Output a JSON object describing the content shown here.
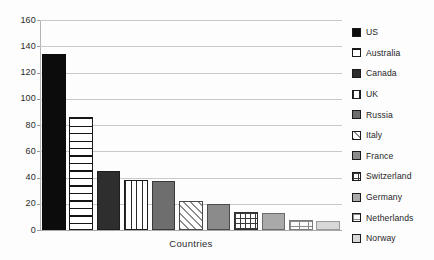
{
  "chart_data": {
    "type": "bar",
    "title": "",
    "xlabel": "Countries",
    "ylabel": "",
    "ylim": [
      0,
      160
    ],
    "ytick_step": 20,
    "yticks": [
      160,
      140,
      120,
      100,
      80,
      60,
      40,
      20,
      0
    ],
    "grid": true,
    "legend_position": "right",
    "categories": [
      "US",
      "Australia",
      "Canada",
      "UK",
      "Russia",
      "Italy",
      "France",
      "Switzerland",
      "Germany",
      "Netherlands",
      "Norway"
    ],
    "values": [
      134,
      86,
      45,
      38,
      37,
      22,
      20,
      14,
      13,
      8,
      6.5
    ],
    "series": [
      {
        "name": "Countries",
        "values": [
          134,
          86,
          45,
          38,
          37,
          22,
          20,
          14,
          13,
          8,
          6.5
        ]
      }
    ],
    "bars": [
      {
        "label": "US",
        "value": 134,
        "pattern": "solid-black"
      },
      {
        "label": "Australia",
        "value": 86,
        "pattern": "horizontal-lines"
      },
      {
        "label": "Canada",
        "value": 45,
        "pattern": "solid-dark-gray"
      },
      {
        "label": "UK",
        "value": 38,
        "pattern": "vertical-lines"
      },
      {
        "label": "Russia",
        "value": 37,
        "pattern": "solid-medium-gray"
      },
      {
        "label": "Italy",
        "value": 22,
        "pattern": "diagonal-hatch"
      },
      {
        "label": "France",
        "value": 20,
        "pattern": "solid-gray"
      },
      {
        "label": "Switzerland",
        "value": 14,
        "pattern": "cross-grid"
      },
      {
        "label": "Germany",
        "value": 13,
        "pattern": "solid-light-gray"
      },
      {
        "label": "Netherlands",
        "value": 8,
        "pattern": "dotted-brick"
      },
      {
        "label": "Norway",
        "value": 6.5,
        "pattern": "solid-pale-gray"
      }
    ]
  },
  "legend": {
    "items": [
      {
        "label": "US"
      },
      {
        "label": "Australia"
      },
      {
        "label": "Canada"
      },
      {
        "label": "UK"
      },
      {
        "label": "Russia"
      },
      {
        "label": "Italy"
      },
      {
        "label": "France"
      },
      {
        "label": "Switzerland"
      },
      {
        "label": "Germany"
      },
      {
        "label": "Netherlands"
      },
      {
        "label": "Norway"
      }
    ]
  },
  "axes": {
    "x_label": "Countries",
    "y_labels": [
      "160",
      "140",
      "120",
      "100",
      "80",
      "60",
      "40",
      "20",
      "0"
    ]
  },
  "colors": {
    "background": "#fdfdfd",
    "gridline": "#c9c9c9",
    "axis": "#b5b5b5",
    "text": "#2b2b2b",
    "bar_outline": "#1a1a1a"
  }
}
